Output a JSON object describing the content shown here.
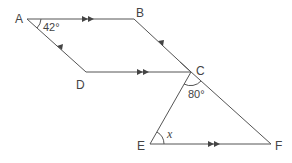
{
  "diagram": {
    "type": "geometry",
    "points": {
      "A": {
        "label": "A",
        "x": 27,
        "y": 19
      },
      "B": {
        "label": "B",
        "x": 134,
        "y": 19
      },
      "C": {
        "label": "C",
        "x": 191,
        "y": 72
      },
      "D": {
        "label": "D",
        "x": 86,
        "y": 72
      },
      "E": {
        "label": "E",
        "x": 150,
        "y": 144
      },
      "F": {
        "label": "F",
        "x": 271,
        "y": 144
      }
    },
    "segments": [
      "AB",
      "BC",
      "CD",
      "DA",
      "CE",
      "CF",
      "EF"
    ],
    "parallel_marks": {
      "double_arrow": [
        "AB",
        "DC",
        "EF"
      ],
      "single_arrow": [
        "DA",
        "CB"
      ]
    },
    "angles": {
      "A": "42°",
      "C": "80°",
      "E": "x"
    }
  }
}
